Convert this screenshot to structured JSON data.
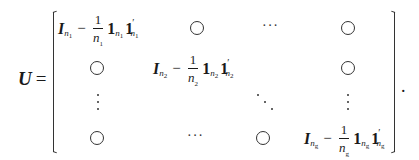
{
  "equation": {
    "lhs": "U",
    "equals": "=",
    "terminator": ".",
    "matrix": {
      "rows": 4,
      "cols": 4,
      "zero_symbol": "○",
      "hdots": "···",
      "diag_blocks": [
        {
          "I": "I",
          "sub": "n",
          "subsub": "1",
          "num": "1",
          "den": "n",
          "den_sub": "1",
          "one": "1",
          "one2": "1",
          "prime": "′"
        },
        {
          "I": "I",
          "sub": "n",
          "subsub": "2",
          "num": "1",
          "den": "n",
          "den_sub": "2",
          "one": "1",
          "one2": "1",
          "prime": "′"
        },
        {
          "I": "I",
          "sub": "n",
          "subsub": "g",
          "num": "1",
          "den": "n",
          "den_sub": "g",
          "one": "1",
          "one2": "1",
          "prime": "′"
        }
      ],
      "cells": [
        [
          "block:1",
          "○",
          "···",
          "○"
        ],
        [
          "○",
          "block:2",
          "",
          "○"
        ],
        [
          "⋮",
          "",
          "⋱",
          "⋮"
        ],
        [
          "○",
          "···",
          "○",
          "block:g"
        ]
      ]
    }
  }
}
